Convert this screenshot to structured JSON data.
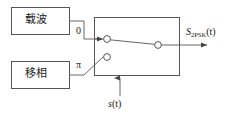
{
  "diagram": {
    "type": "block-diagram",
    "stroke_color": "#555555",
    "text_color": "#1a1a1a",
    "background": "#ffffff",
    "blocks": [
      {
        "id": "carrier",
        "label": "载波",
        "x": 11,
        "y": 7,
        "w": 58,
        "h": 27
      },
      {
        "id": "phase-shifter",
        "label": "移相",
        "x": 11,
        "y": 61,
        "w": 58,
        "h": 27
      },
      {
        "id": "switch",
        "label": "",
        "x": 94,
        "y": 17,
        "w": 85,
        "h": 58
      }
    ],
    "labels": {
      "carrier": "载波",
      "phase_shifter": "移相",
      "branch_zero": "0",
      "branch_pi": "π",
      "output_symbol": "S",
      "output_subscript": "2PSK",
      "output_arg": "(t)",
      "control_symbol": "s",
      "control_arg": "(t)"
    },
    "switch": {
      "contact_top": {
        "cx": 107,
        "cy": 39,
        "r": 3.4
      },
      "contact_bottom": {
        "cx": 107,
        "cy": 57,
        "r": 3.4
      },
      "pivot": {
        "cx": 158,
        "cy": 45,
        "r": 3.4
      },
      "arm_from": "contact_top",
      "arm_to": "pivot",
      "selected_branch": "0"
    },
    "signals": [
      {
        "name": "carrier-to-zero",
        "from": "carrier",
        "to": "branch_zero"
      },
      {
        "name": "phase-to-pi",
        "from": "phase-shifter",
        "to": "branch_pi"
      },
      {
        "name": "zero-input",
        "from": "branch_zero",
        "to": "contact_top",
        "arrow": true
      },
      {
        "name": "pi-input",
        "from": "branch_pi",
        "to": "contact_bottom",
        "arrow": false
      },
      {
        "name": "output",
        "from": "pivot",
        "to": "output_symbol",
        "arrow": true
      },
      {
        "name": "control",
        "from": "control_symbol",
        "to": "switch",
        "arrow": true,
        "direction": "up"
      }
    ]
  }
}
